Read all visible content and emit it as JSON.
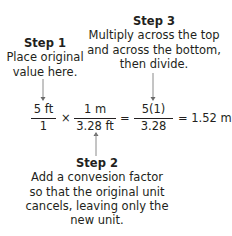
{
  "step1": {
    "heading": "Step 1",
    "lines": [
      "Place original",
      "value here."
    ]
  },
  "step2": {
    "heading": "Step 2",
    "lines": [
      "Add a convesion factor",
      "so that the original unit",
      "cancels, leaving only the",
      "new unit."
    ]
  },
  "step3": {
    "heading": "Step 3",
    "lines": [
      "Multiply across the top",
      "and across the bottom,",
      "then divide."
    ]
  },
  "equation": {
    "fraction1": {
      "numerator": "5 ft",
      "denominator": "1"
    },
    "times": "×",
    "fraction2": {
      "numerator": "1 m",
      "denominator": "3.28 ft"
    },
    "equals1": "=",
    "fraction3": {
      "numerator": "5(1)",
      "denominator": "3.28"
    },
    "result": "= 1.52 m"
  },
  "colors": {
    "text": "#231f20",
    "arrow": "#8a8a8a",
    "background": "#ffffff"
  }
}
